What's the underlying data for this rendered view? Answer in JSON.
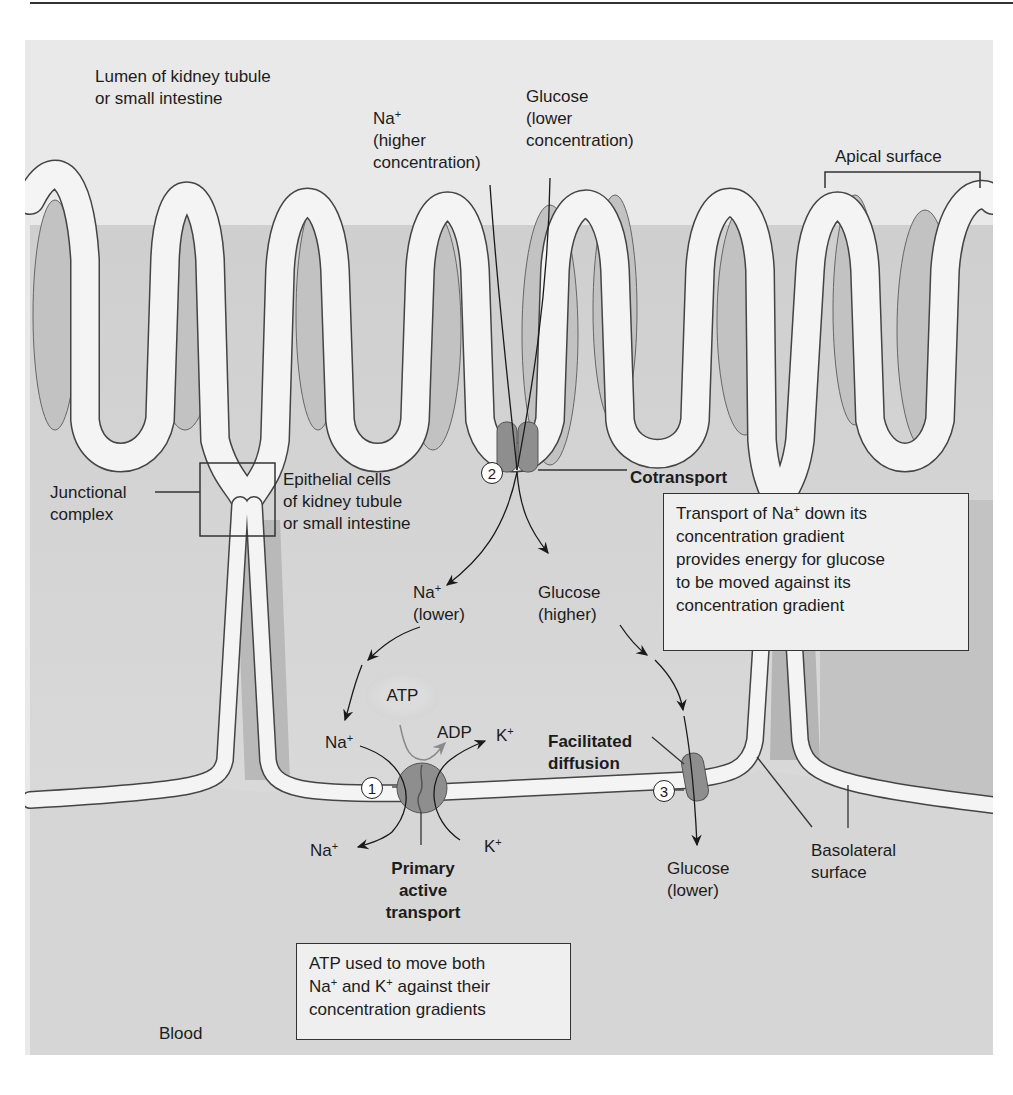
{
  "diagram": {
    "regions": {
      "lumen": {
        "line1": "Lumen of kidney tubule",
        "line2": "or small intestine"
      },
      "blood": "Blood",
      "apical_surface": "Apical surface",
      "basolateral_surface": {
        "line1": "Basolateral",
        "line2": "surface"
      },
      "junctional_complex": {
        "line1": "Junctional",
        "line2": "complex"
      },
      "epithelial_cells": {
        "line1": "Epithelial cells",
        "line2": "of kidney tubule",
        "line3": "or small intestine"
      }
    },
    "solutes": {
      "na_top": {
        "ion": "Na",
        "charge": "+",
        "line2": "(higher",
        "line3": "concentration)"
      },
      "glucose_top": {
        "line1": "Glucose",
        "line2": "(lower",
        "line3": "concentration)"
      },
      "na_lower": {
        "ion": "Na",
        "charge": "+",
        "line2": "(lower)"
      },
      "glucose_higher": {
        "line1": "Glucose",
        "line2": "(higher)"
      },
      "na_in": {
        "ion": "Na",
        "charge": "+"
      },
      "na_out": {
        "ion": "Na",
        "charge": "+"
      },
      "k_out": {
        "ion": "K",
        "charge": "+"
      },
      "k_in": {
        "ion": "K",
        "charge": "+"
      },
      "atp": "ATP",
      "adp": "ADP",
      "glucose_lower": {
        "line1": "Glucose",
        "line2": "(lower)"
      }
    },
    "transporters": {
      "primary": {
        "number": "1",
        "line1": "Primary",
        "line2": "active",
        "line3": "transport"
      },
      "cotransport": {
        "number": "2",
        "label": "Cotransport"
      },
      "facilitated": {
        "number": "3",
        "line1": "Facilitated",
        "line2": "diffusion"
      }
    },
    "callouts": {
      "cotransport_box": {
        "l1a": "Transport of Na",
        "l1sup": "+",
        "l1b": " down its",
        "l2": "concentration gradient",
        "l3": "provides energy for glucose",
        "l4": "to be moved against its",
        "l5": "concentration gradient"
      },
      "atp_box": {
        "l1": "ATP used to move both",
        "l2a": "Na",
        "l2sup1": "+",
        "l2b": " and K",
        "l2sup2": "+",
        "l2c": " against their",
        "l3": "concentration gradients"
      }
    },
    "colors": {
      "background": "#e9e9e9",
      "membrane": "#f4f4f4",
      "cytoplasm_light": "#dcdcdc",
      "cytoplasm_dark": "#bdbdbd",
      "transporter": "#8e8e8e",
      "outline": "#333333"
    }
  }
}
